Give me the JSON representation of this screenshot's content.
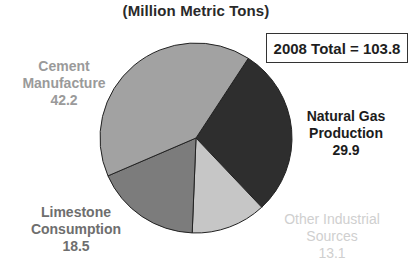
{
  "chart_data": {
    "type": "pie",
    "title": "(Million Metric Tons)",
    "annotation": "2008 Total = 103.8",
    "total": 103.8,
    "unit": "Million Metric Tons",
    "start_angle_deg_clockwise_from_top": 33,
    "slices": [
      {
        "name": "Natural Gas Production",
        "label_lines": [
          "Natural Gas",
          "Production"
        ],
        "value": 29.9,
        "value_label": "29.9",
        "fill": "#2e2e2e",
        "text_color": "#1c1c1c"
      },
      {
        "name": "Other Industrial Sources",
        "label_lines": [
          "Other Industrial",
          "Sources"
        ],
        "value": 13.1,
        "value_label": "13.1",
        "fill": "#c6c6c6",
        "text_color": "#cfcfcf"
      },
      {
        "name": "Limestone Consumption",
        "label_lines": [
          "Limestone",
          "Consumption"
        ],
        "value": 18.5,
        "value_label": "18.5",
        "fill": "#7c7c7c",
        "text_color": "#6e6e6e"
      },
      {
        "name": "Cement Manufacture",
        "label_lines": [
          "Cement",
          "Manufacture"
        ],
        "value": 42.2,
        "value_label": "42.2",
        "fill": "#a2a2a2",
        "text_color": "#9a9a9a"
      }
    ],
    "legend": "none (direct labels)",
    "grid": false
  },
  "labels": {
    "natural_gas": {
      "line1": "Natural Gas",
      "line2": "Production",
      "value": "29.9"
    },
    "other": {
      "line1": "Other Industrial",
      "line2": "Sources",
      "value": "13.1"
    },
    "limestone": {
      "line1": "Limestone",
      "line2": "Consumption",
      "value": "18.5"
    },
    "cement": {
      "line1": "Cement",
      "line2": "Manufacture",
      "value": "42.2"
    }
  }
}
